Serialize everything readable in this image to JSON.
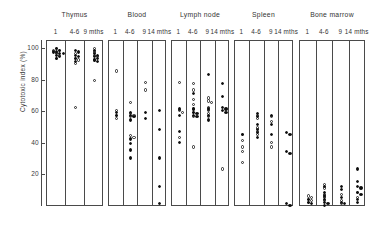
{
  "chart_data": {
    "type": "scatter",
    "title": "",
    "xlabel": "",
    "ylabel": "Cytotoxic index (%)",
    "ylim": [
      0,
      105
    ],
    "yticks": [
      20,
      40,
      60,
      80,
      100
    ],
    "ytick_labels": [
      "20",
      "40",
      "60",
      "80",
      "100"
    ],
    "grid": false,
    "legend": {
      "filled": "filled circle",
      "open": "open circle"
    },
    "panels": [
      {
        "name": "Thymus",
        "groups": [
          {
            "label": "1",
            "open": [
              100,
              99,
              97,
              96,
              99,
              94
            ],
            "filled": [
              100,
              99,
              98,
              97,
              96,
              95,
              94,
              98,
              97
            ]
          },
          {
            "label": "4-6",
            "open": [
              97,
              94,
              93,
              91,
              63
            ],
            "filled": [
              99,
              98,
              96,
              95,
              94,
              92
            ]
          },
          {
            "label": "9 mths",
            "open": [
              100,
              98,
              96,
              95,
              93,
              80
            ],
            "filled": [
              99,
              97,
              96,
              95,
              94,
              93,
              92
            ]
          }
        ]
      },
      {
        "name": "Blood",
        "groups": [
          {
            "label": "1",
            "open": [
              86,
              61,
              58,
              56
            ],
            "filled": [
              60,
              58
            ]
          },
          {
            "label": "4-6",
            "open": [
              66,
              59,
              58,
              57,
              45,
              44
            ],
            "filled": [
              60,
              58,
              57,
              55,
              43,
              40,
              36,
              31
            ]
          },
          {
            "label": "9",
            "open": [
              79,
              74
            ],
            "filled": [
              60,
              56
            ]
          },
          {
            "label": "14 mths",
            "open": [],
            "filled": [
              61,
              49,
              31,
              13,
              2
            ]
          }
        ]
      },
      {
        "name": "Lymph node",
        "groups": [
          {
            "label": "1",
            "open": [
              79,
              61,
              60,
              44
            ],
            "filled": [
              62,
              58,
              48,
              41
            ]
          },
          {
            "label": "4-6",
            "open": [
              78,
              74,
              68,
              65,
              62,
              60,
              57,
              38
            ],
            "filled": [
              72,
              62,
              60,
              59,
              58,
              57
            ]
          },
          {
            "label": "9",
            "open": [
              69,
              67,
              66,
              63,
              61,
              59,
              57
            ],
            "filled": [
              84,
              62,
              58,
              55
            ]
          },
          {
            "label": "14 mths",
            "open": [
              24
            ],
            "filled": [
              78,
              70,
              63,
              62,
              61,
              60
            ]
          }
        ]
      },
      {
        "name": "Spleen",
        "groups": [
          {
            "label": "1",
            "open": [
              46,
              42,
              38,
              35,
              28
            ],
            "filled": [
              46
            ]
          },
          {
            "label": "4-6",
            "open": [
              58,
              56,
              50,
              48,
              46
            ],
            "filled": [
              59,
              57,
              52,
              49,
              47,
              44
            ]
          },
          {
            "label": "9",
            "open": [
              57,
              54,
              41,
              38
            ],
            "filled": [
              58,
              52,
              46
            ]
          },
          {
            "label": "14 mths",
            "open": [],
            "filled": [
              47,
              46,
              35,
              34,
              2,
              1
            ]
          }
        ]
      },
      {
        "name": "Bone marrow",
        "groups": [
          {
            "label": "1",
            "open": [
              7,
              6,
              5,
              4,
              3
            ],
            "filled": [
              5,
              3,
              2
            ]
          },
          {
            "label": "4-6",
            "open": [
              14,
              12,
              8,
              6,
              4
            ],
            "filled": [
              13,
              9,
              7,
              5,
              3,
              2,
              1
            ]
          },
          {
            "label": "9",
            "open": [
              8,
              4,
              2
            ],
            "filled": [
              13,
              11,
              6,
              3,
              2
            ]
          },
          {
            "label": "14 mths",
            "open": [
              9,
              6
            ],
            "filled": [
              24,
              16,
              13,
              12,
              9,
              8,
              5,
              3
            ]
          }
        ]
      }
    ]
  }
}
